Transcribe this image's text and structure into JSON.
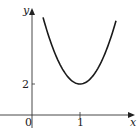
{
  "chart_data": {
    "type": "line",
    "title": "",
    "xlabel": "x",
    "ylabel": "y",
    "origin_label": "0",
    "x_ticks": [
      {
        "value": 1,
        "label": "1"
      }
    ],
    "y_ticks": [
      {
        "value": 2,
        "label": "2"
      }
    ],
    "series": [
      {
        "name": "curve",
        "description": "U-shaped curve with minimum at (1, 2)",
        "x": [
          0.23,
          0.4,
          0.6,
          0.8,
          1.0,
          1.2,
          1.4,
          1.6,
          1.75
        ],
        "y": [
          6.3,
          4.6,
          3.15,
          2.29,
          2.0,
          2.29,
          3.15,
          4.6,
          6.3
        ]
      }
    ],
    "minimum": {
      "x": 1,
      "y": 2
    },
    "grid": false,
    "legend": false,
    "colors": {
      "axis": "#333333",
      "curve": "#1a1a1a"
    }
  }
}
